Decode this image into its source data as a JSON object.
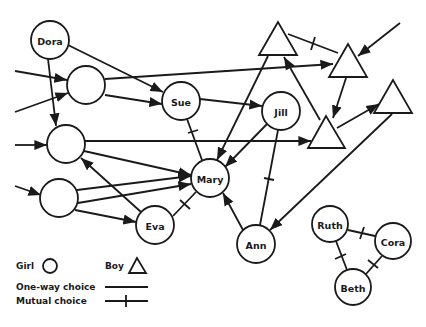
{
  "diagram": {
    "title": "",
    "nodes": [
      {
        "id": "dora",
        "label": "Dora",
        "type": "girl",
        "x": 50,
        "y": 40
      },
      {
        "id": "u1",
        "label": "",
        "type": "girl",
        "x": 86,
        "y": 85
      },
      {
        "id": "sue",
        "label": "Sue",
        "type": "girl",
        "x": 181,
        "y": 101
      },
      {
        "id": "jill",
        "label": "Jill",
        "type": "girl",
        "x": 281,
        "y": 111
      },
      {
        "id": "u2",
        "label": "",
        "type": "girl",
        "x": 66,
        "y": 144
      },
      {
        "id": "mary",
        "label": "Mary",
        "type": "girl",
        "x": 210,
        "y": 178
      },
      {
        "id": "u3",
        "label": "",
        "type": "girl",
        "x": 59,
        "y": 198
      },
      {
        "id": "eva",
        "label": "Eva",
        "type": "girl",
        "x": 155,
        "y": 225
      },
      {
        "id": "ann",
        "label": "Ann",
        "type": "girl",
        "x": 256,
        "y": 244
      },
      {
        "id": "ruth",
        "label": "Ruth",
        "type": "girl",
        "x": 330,
        "y": 224
      },
      {
        "id": "cora",
        "label": "Cora",
        "type": "girl",
        "x": 393,
        "y": 241
      },
      {
        "id": "beth",
        "label": "Beth",
        "type": "girl",
        "x": 353,
        "y": 287
      },
      {
        "id": "t1",
        "label": "",
        "type": "boy",
        "x": 278,
        "y": 42
      },
      {
        "id": "t2",
        "label": "",
        "type": "boy",
        "x": 348,
        "y": 64
      },
      {
        "id": "t3",
        "label": "",
        "type": "boy",
        "x": 393,
        "y": 100
      },
      {
        "id": "t4",
        "label": "",
        "type": "boy",
        "x": 326,
        "y": 136
      }
    ],
    "edges": [
      {
        "from": "ext-left-1",
        "to": "u1",
        "kind": "one-way"
      },
      {
        "from": "ext-left-2",
        "to": "u1",
        "kind": "one-way"
      },
      {
        "from": "ext-left-3",
        "to": "u2",
        "kind": "one-way"
      },
      {
        "from": "ext-left-4",
        "to": "u3",
        "kind": "one-way"
      },
      {
        "from": "ext-topright",
        "to": "t2",
        "kind": "one-way"
      },
      {
        "from": "dora",
        "to": "sue",
        "kind": "one-way"
      },
      {
        "from": "dora",
        "to": "u2",
        "kind": "one-way"
      },
      {
        "from": "u1",
        "to": "sue",
        "kind": "one-way"
      },
      {
        "from": "u1",
        "to": "t2",
        "kind": "one-way"
      },
      {
        "from": "sue",
        "to": "jill",
        "kind": "one-way"
      },
      {
        "from": "sue",
        "to": "mary",
        "kind": "mutual"
      },
      {
        "from": "jill",
        "to": "mary",
        "kind": "one-way"
      },
      {
        "from": "jill",
        "to": "ann",
        "kind": "mutual"
      },
      {
        "from": "t1",
        "to": "t2",
        "kind": "mutual"
      },
      {
        "from": "t1",
        "to": "mary",
        "kind": "one-way"
      },
      {
        "from": "t4",
        "to": "t1",
        "kind": "one-way"
      },
      {
        "from": "t2",
        "to": "t4",
        "kind": "one-way"
      },
      {
        "from": "t4",
        "to": "t3",
        "kind": "one-way"
      },
      {
        "from": "t3",
        "to": "ann",
        "kind": "one-way"
      },
      {
        "from": "u2",
        "to": "t4",
        "kind": "one-way"
      },
      {
        "from": "u2",
        "to": "mary",
        "kind": "one-way"
      },
      {
        "from": "u3",
        "to": "mary",
        "kind": "one-way"
      },
      {
        "from": "u3",
        "to": "mary",
        "kind": "one-way"
      },
      {
        "from": "u3",
        "to": "eva",
        "kind": "one-way"
      },
      {
        "from": "eva",
        "to": "u2",
        "kind": "one-way"
      },
      {
        "from": "eva",
        "to": "mary",
        "kind": "mutual"
      },
      {
        "from": "ann",
        "to": "mary",
        "kind": "one-way"
      },
      {
        "from": "ruth",
        "to": "cora",
        "kind": "mutual"
      },
      {
        "from": "ruth",
        "to": "beth",
        "kind": "mutual"
      },
      {
        "from": "cora",
        "to": "beth",
        "kind": "mutual"
      }
    ]
  },
  "legend": {
    "girl_label": "Girl",
    "boy_label": "Boy",
    "one_way_label": "One-way choice",
    "mutual_label": "Mutual choice"
  },
  "colors": {
    "stroke": "#1a1a1a",
    "background": "#ffffff"
  }
}
